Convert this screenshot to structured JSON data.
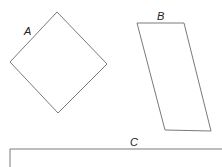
{
  "diagram": {
    "stroke_color": "#7a7a7a",
    "label_color": "#222222",
    "shapes": [
      {
        "id": "A",
        "label": "A",
        "type": "square-rotated",
        "points": "57,12 107,64 58,113 10,62",
        "label_pos": [
          24,
          35
        ]
      },
      {
        "id": "B",
        "label": "B",
        "type": "parallelogram",
        "points": "137,23 184,23 211,131 165,130",
        "label_pos": [
          157,
          20
        ]
      },
      {
        "id": "C",
        "label": "C",
        "type": "rectangle-partial",
        "path": "M10,170 L10,149 L222,149",
        "label_pos": [
          130,
          146
        ]
      }
    ]
  }
}
